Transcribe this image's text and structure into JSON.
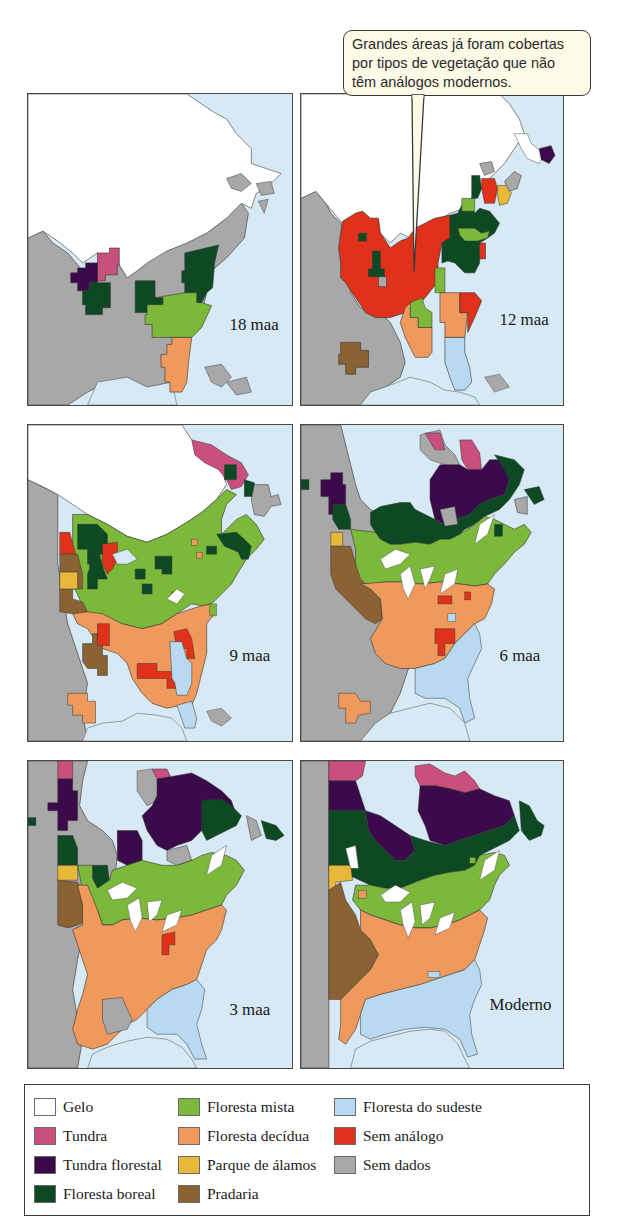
{
  "callout": {
    "lines": [
      "Grandes áreas já foram cobertas",
      "por tipos de vegetação que não",
      "têm análogos modernos."
    ]
  },
  "panels": [
    {
      "id": "18maa",
      "label": "18 maa"
    },
    {
      "id": "12maa",
      "label": "12 maa"
    },
    {
      "id": "9maa",
      "label": "9 maa"
    },
    {
      "id": "6maa",
      "label": "6 maa"
    },
    {
      "id": "3maa",
      "label": "3 maa"
    },
    {
      "id": "moderno",
      "label": "Moderno"
    }
  ],
  "legend": {
    "items": [
      {
        "label": "Gelo",
        "color": "#ffffff"
      },
      {
        "label": "Tundra",
        "color": "#c94f7c"
      },
      {
        "label": "Tundra florestal",
        "color": "#3a0a4a"
      },
      {
        "label": "Floresta boreal",
        "color": "#0d4a24"
      },
      {
        "label": "Floresta mista",
        "color": "#7cb83a"
      },
      {
        "label": "Floresta decídua",
        "color": "#ef9a5c"
      },
      {
        "label": "Parque de álamos",
        "color": "#e8b83a"
      },
      {
        "label": "Pradaria",
        "color": "#8a6234"
      },
      {
        "label": "Floresta do sudeste",
        "color": "#b9d9f0"
      },
      {
        "label": "Sem análogo",
        "color": "#e0321a"
      },
      {
        "label": "Sem dados",
        "color": "#a8a8a8"
      }
    ]
  },
  "colors": {
    "water": "#d6e9f5",
    "ice": "#ffffff",
    "tundra": "#c94f7c",
    "forest_tundra": "#3a0a4a",
    "boreal": "#0d4a24",
    "mixed": "#7cb83a",
    "deciduous": "#ef9a5c",
    "aspen": "#e8b83a",
    "prairie": "#8a6234",
    "southeast": "#b9d9f0",
    "no_analog": "#e0321a",
    "no_data": "#a8a8a8"
  }
}
